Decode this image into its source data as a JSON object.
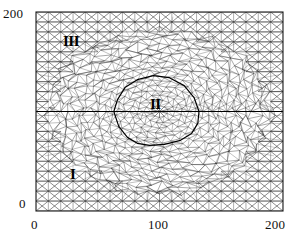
{
  "figure": {
    "kind": "finite-element-mesh-plot",
    "background_color": "#ffffff",
    "line_color": "#2a2a2a",
    "frame": {
      "left_px": 36,
      "top_px": 12,
      "right_px": 283,
      "bottom_px": 211
    }
  },
  "axes": {
    "x": {
      "min": 0,
      "max": 200,
      "ticks": [
        0,
        100,
        200
      ],
      "tick_labels": [
        "0",
        "100",
        "200"
      ],
      "label": ""
    },
    "y": {
      "min": 0,
      "max": 200,
      "ticks": [
        0,
        200
      ],
      "tick_labels": [
        "0",
        "200"
      ],
      "label": ""
    },
    "grid": false,
    "frame_visible": true
  },
  "labels": {
    "y_top": "200",
    "y_bottom": "0",
    "x_left": "0",
    "x_mid": "100",
    "x_right": "200"
  },
  "regions": [
    {
      "id": "region-I",
      "text": "I",
      "x_data": 29,
      "y_data": 45,
      "description": "outer coarse-mesh region, lower left"
    },
    {
      "id": "region-II",
      "text": "II",
      "x_data": 98,
      "y_data": 102,
      "description": "inner closed sub-domain, centre"
    },
    {
      "id": "region-III",
      "text": "III",
      "x_data": 26,
      "y_data": 170,
      "description": "upper-left coarse-mesh region"
    }
  ],
  "chart_data": {
    "type": "line",
    "title": "",
    "xlabel": "",
    "ylabel": "",
    "xlim": [
      0,
      200
    ],
    "ylim": [
      0,
      200
    ],
    "grid": false,
    "legend": "none",
    "annotations": [
      "I",
      "II",
      "III"
    ],
    "series": [
      {
        "name": "horizontal interface line",
        "x": [
          0,
          200
        ],
        "y": [
          100,
          100
        ]
      },
      {
        "name": "region II boundary",
        "closed": true,
        "x": [
          63,
          66,
          72,
          82,
          95,
          108,
          120,
          128,
          132,
          131,
          126,
          117,
          104,
          92,
          82,
          74,
          67,
          63
        ],
        "y": [
          100,
          112,
          124,
          132,
          136,
          134,
          126,
          114,
          100,
          88,
          78,
          71,
          67,
          66,
          68,
          74,
          85,
          100
        ]
      },
      {
        "name": "refinement zone outline (approx ellipse)",
        "closed": true,
        "x": [
          14,
          28,
          50,
          78,
          104,
          130,
          156,
          176,
          188,
          190,
          180,
          158,
          130,
          100,
          70,
          44,
          24,
          14
        ],
        "y": [
          100,
          138,
          163,
          178,
          183,
          182,
          174,
          154,
          124,
          92,
          62,
          36,
          22,
          17,
          19,
          32,
          60,
          100
        ]
      }
    ],
    "mesh": {
      "description": "unstructured triangular finite-element mesh; coarse structured criss-cross triangles in the outer domain, progressively refined triangles inside the central elliptical zone",
      "coarse_cell_size_data": 10,
      "fine_cell_size_data": 3.3,
      "element_type": "triangle"
    }
  }
}
